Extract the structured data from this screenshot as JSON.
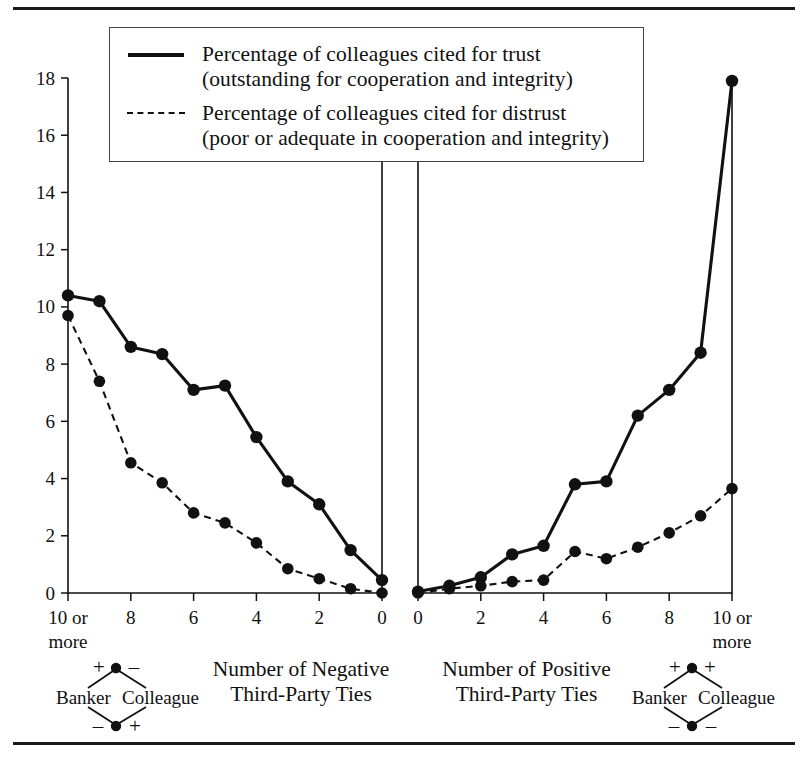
{
  "figure": {
    "top_rule": true,
    "bottom_rule": true
  },
  "legend": {
    "position": "top-center",
    "entries": [
      {
        "style": "solid",
        "line1": "Percentage of colleagues cited for trust",
        "line2": "(outstanding for cooperation and integrity)"
      },
      {
        "style": "dashed",
        "line1": "Percentage of colleagues cited for distrust",
        "line2": "(poor or adequate in cooperation and integrity)"
      }
    ]
  },
  "captions": {
    "left": {
      "line1": "Number of Negative",
      "line2": "Third-Party Ties"
    },
    "right": {
      "line1": "Number of Positive",
      "line2": "Third-Party Ties"
    }
  },
  "triads": {
    "left": {
      "banker": "Banker",
      "colleague": "Colleague",
      "top_left_sign": "+",
      "top_right_sign": "–",
      "bottom_left_sign": "–",
      "bottom_right_sign": "+"
    },
    "right": {
      "banker": "Banker",
      "colleague": "Colleague",
      "top_left_sign": "+",
      "top_right_sign": "+",
      "bottom_left_sign": "–",
      "bottom_right_sign": "–"
    }
  },
  "chart_data": [
    {
      "id": "left-panel",
      "type": "line",
      "title": "Number of Negative Third-Party Ties",
      "xlabel": "Number of Negative Third-Party Ties",
      "ylabel": "",
      "x_tick_labels": [
        "10 or more",
        "",
        "8",
        "",
        "6",
        "",
        "4",
        "",
        "2",
        "",
        "0"
      ],
      "x_values": [
        10,
        9,
        8,
        7,
        6,
        5,
        4,
        3,
        2,
        1,
        0
      ],
      "x_direction": "reversed",
      "ylim": [
        0,
        18
      ],
      "y_ticks": [
        0,
        2,
        4,
        6,
        8,
        10,
        12,
        14,
        16,
        18
      ],
      "grid": false,
      "series": [
        {
          "name": "Percentage of colleagues cited for trust (outstanding for cooperation and integrity)",
          "style": "solid",
          "values": [
            10.4,
            10.2,
            8.6,
            8.35,
            7.1,
            7.25,
            5.45,
            3.9,
            3.1,
            1.5,
            0.45
          ]
        },
        {
          "name": "Percentage of colleagues cited for distrust (poor or adequate in cooperation and integrity)",
          "style": "dashed",
          "values": [
            9.7,
            7.4,
            4.55,
            3.85,
            2.8,
            2.45,
            1.75,
            0.85,
            0.5,
            0.15,
            0.0
          ]
        }
      ]
    },
    {
      "id": "right-panel",
      "type": "line",
      "title": "Number of Positive Third-Party Ties",
      "xlabel": "Number of Positive Third-Party Ties",
      "ylabel": "",
      "x_tick_labels": [
        "0",
        "",
        "2",
        "",
        "4",
        "",
        "6",
        "",
        "8",
        "",
        "10 or more"
      ],
      "x_values": [
        0,
        1,
        2,
        3,
        4,
        5,
        6,
        7,
        8,
        9,
        10
      ],
      "x_direction": "normal",
      "ylim": [
        0,
        18
      ],
      "y_ticks": [
        0,
        2,
        4,
        6,
        8,
        10,
        12,
        14,
        16,
        18
      ],
      "grid": false,
      "series": [
        {
          "name": "Percentage of colleagues cited for trust (outstanding for cooperation and integrity)",
          "style": "solid",
          "values": [
            0.05,
            0.25,
            0.55,
            1.35,
            1.65,
            3.8,
            3.9,
            6.2,
            7.1,
            8.4,
            17.9
          ]
        },
        {
          "name": "Percentage of colleagues cited for distrust (poor or adequate in cooperation and integrity)",
          "style": "dashed",
          "values": [
            0.0,
            0.15,
            0.25,
            0.4,
            0.45,
            1.45,
            1.2,
            1.6,
            2.1,
            2.7,
            3.65
          ]
        }
      ]
    }
  ],
  "axis": {
    "y_labels": [
      "18",
      "16",
      "14",
      "12",
      "10",
      "8",
      "6",
      "4",
      "2",
      "0"
    ],
    "left_x_labels": [
      "10 or",
      "more",
      "8",
      "6",
      "4",
      "2",
      "0"
    ],
    "right_x_labels": [
      "0",
      "2",
      "4",
      "6",
      "8",
      "10 or",
      "more"
    ]
  },
  "colors": {
    "ink": "#111111",
    "background": "#ffffff",
    "legend_border": "#444444"
  }
}
